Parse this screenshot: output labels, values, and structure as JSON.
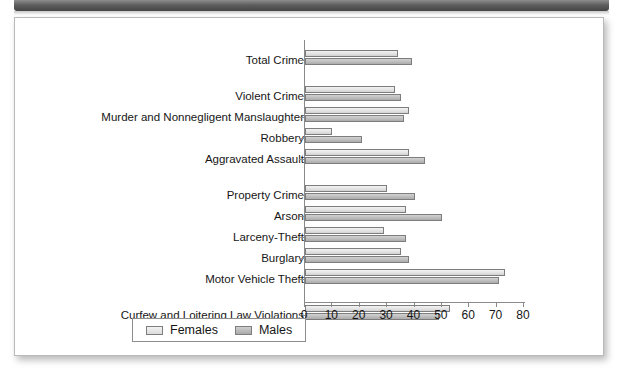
{
  "figure": {
    "legend": {
      "entries": [
        {
          "label": "Females",
          "swatch": "light-gray-swatch"
        },
        {
          "label": "Males",
          "swatch": "dark-gray-swatch"
        }
      ]
    }
  },
  "chart_data": {
    "type": "bar",
    "orientation": "horizontal",
    "title": "",
    "xlabel": "",
    "ylabel": "",
    "xlim": [
      0,
      80
    ],
    "xticks": [
      0,
      10,
      20,
      30,
      40,
      50,
      60,
      70,
      80
    ],
    "grid": false,
    "legend_position": "bottom",
    "categories": [
      "Total Crime",
      "Violent Crime",
      "Murder and Nonnegligent Manslaughter",
      "Robbery",
      "Aggravated Assault",
      "Property Crime",
      "Arson",
      "Larceny-Theft",
      "Burglary",
      "Motor Vehicle Theft",
      "Curfew and Loitering Law Violations"
    ],
    "series": [
      {
        "name": "Females",
        "color": "#e3e3e3",
        "values": [
          34,
          33,
          38,
          10,
          38,
          30,
          37,
          29,
          35,
          73,
          53
        ]
      },
      {
        "name": "Males",
        "color": "#bdbdbd",
        "values": [
          39,
          35,
          36,
          21,
          44,
          40,
          50,
          37,
          38,
          71,
          49
        ]
      }
    ],
    "group_gaps_after": [
      0,
      4,
      9
    ]
  }
}
